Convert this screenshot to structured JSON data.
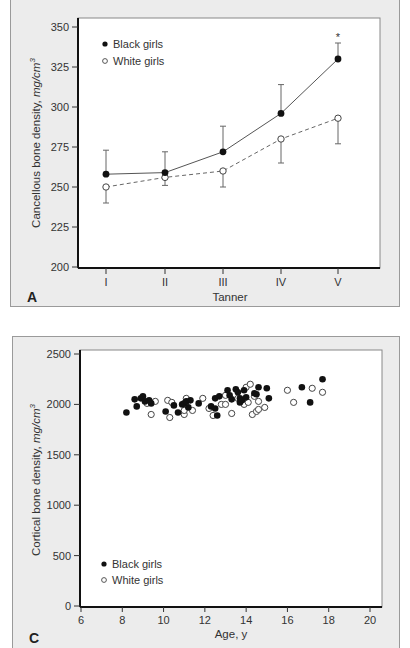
{
  "panels": {
    "A": {
      "letter": "A",
      "xlabel": "Tanner",
      "ylabel": "Cancellous bone density, mg/cm³",
      "ylabel_main": "Cancellous bone density, ",
      "ylabel_unit": "mg/cm",
      "ylabel_sup": "3",
      "legend": [
        "Black girls",
        "White girls"
      ],
      "significance_marker": "*"
    },
    "C": {
      "letter": "C",
      "xlabel": "Age, y",
      "ylabel": "Cortical bone density, mg/cm³",
      "ylabel_main": "Cortical bone density, ",
      "ylabel_unit": "mg/cm",
      "ylabel_sup": "3",
      "legend": [
        "Black girls",
        "White girls"
      ]
    }
  },
  "chart_data": [
    {
      "type": "line",
      "panel": "A",
      "title": "",
      "xlabel": "Tanner",
      "ylabel": "Cancellous bone density, mg/cm³",
      "categories": [
        "I",
        "II",
        "III",
        "IV",
        "V"
      ],
      "ylim": [
        200,
        350
      ],
      "yticks": [
        200,
        225,
        250,
        275,
        300,
        325,
        350
      ],
      "grid": false,
      "legend_position": "upper-left",
      "series": [
        {
          "name": "Black girls",
          "marker": "filled-circle",
          "line": "solid",
          "values": [
            258,
            259,
            272,
            296,
            330
          ],
          "error_upper": [
            273,
            272,
            288,
            314,
            340
          ]
        },
        {
          "name": "White girls",
          "marker": "open-circle",
          "line": "dashed",
          "values": [
            250,
            256,
            260,
            280,
            293
          ],
          "error_lower": [
            240,
            251,
            250,
            265,
            277
          ]
        }
      ],
      "annotations": [
        {
          "text": "*",
          "x": "V",
          "y": 345
        }
      ]
    },
    {
      "type": "scatter",
      "panel": "C",
      "title": "",
      "xlabel": "Age, y",
      "ylabel": "Cortical bone density, mg/cm³",
      "xlim": [
        6,
        20
      ],
      "ylim": [
        0,
        2500
      ],
      "xticks": [
        6,
        8,
        10,
        12,
        14,
        16,
        18,
        20
      ],
      "yticks": [
        0,
        500,
        1000,
        1500,
        2000,
        2500
      ],
      "grid": false,
      "legend_position": "lower-left",
      "series": [
        {
          "name": "Black girls",
          "marker": "filled-circle",
          "points": [
            [
              8.2,
              1920
            ],
            [
              8.6,
              2050
            ],
            [
              8.7,
              1980
            ],
            [
              8.9,
              2060
            ],
            [
              9.0,
              2080
            ],
            [
              9.1,
              2030
            ],
            [
              9.3,
              2040
            ],
            [
              9.4,
              2010
            ],
            [
              10.1,
              1930
            ],
            [
              10.5,
              1990
            ],
            [
              10.7,
              1920
            ],
            [
              10.9,
              2000
            ],
            [
              11.0,
              2010
            ],
            [
              11.1,
              2030
            ],
            [
              11.2,
              1970
            ],
            [
              11.3,
              2040
            ],
            [
              11.7,
              2010
            ],
            [
              12.3,
              1980
            ],
            [
              12.5,
              2060
            ],
            [
              12.5,
              1960
            ],
            [
              12.6,
              1890
            ],
            [
              12.7,
              2080
            ],
            [
              13.1,
              2140
            ],
            [
              13.2,
              2090
            ],
            [
              13.3,
              2050
            ],
            [
              13.5,
              2150
            ],
            [
              13.6,
              2120
            ],
            [
              13.7,
              2020
            ],
            [
              13.7,
              2060
            ],
            [
              13.8,
              2040
            ],
            [
              13.9,
              2140
            ],
            [
              14.0,
              2070
            ],
            [
              14.4,
              2110
            ],
            [
              14.5,
              2100
            ],
            [
              14.6,
              2170
            ],
            [
              15.0,
              2160
            ],
            [
              15.1,
              2060
            ],
            [
              16.7,
              2170
            ],
            [
              17.1,
              2020
            ],
            [
              17.7,
              2250
            ]
          ]
        },
        {
          "name": "White girls",
          "marker": "open-circle",
          "points": [
            [
              9.2,
              2010
            ],
            [
              9.4,
              1900
            ],
            [
              9.6,
              2030
            ],
            [
              10.2,
              2040
            ],
            [
              10.3,
              1870
            ],
            [
              10.4,
              2020
            ],
            [
              11.0,
              1900
            ],
            [
              11.0,
              1940
            ],
            [
              11.1,
              2060
            ],
            [
              11.4,
              1940
            ],
            [
              11.9,
              2060
            ],
            [
              12.2,
              1960
            ],
            [
              12.4,
              1890
            ],
            [
              12.8,
              2000
            ],
            [
              13.0,
              2090
            ],
            [
              13.0,
              2000
            ],
            [
              13.3,
              1910
            ],
            [
              13.6,
              2060
            ],
            [
              13.9,
              2000
            ],
            [
              14.0,
              2170
            ],
            [
              14.1,
              2020
            ],
            [
              14.2,
              2200
            ],
            [
              14.3,
              1900
            ],
            [
              14.4,
              2080
            ],
            [
              14.5,
              1930
            ],
            [
              14.6,
              1950
            ],
            [
              14.6,
              2030
            ],
            [
              14.9,
              1970
            ],
            [
              16.0,
              2140
            ],
            [
              16.3,
              2020
            ],
            [
              17.2,
              2160
            ],
            [
              17.7,
              2120
            ]
          ]
        }
      ]
    }
  ]
}
